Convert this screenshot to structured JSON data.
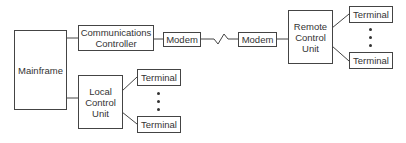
{
  "diagram": {
    "nodes": {
      "mainframe": {
        "label": "Mainframe"
      },
      "comm_controller": {
        "label": "Communications\nController"
      },
      "modem_local": {
        "label": "Modem"
      },
      "modem_remote": {
        "label": "Modem"
      },
      "remote_control_unit": {
        "label": "Remote\nControl\nUnit"
      },
      "remote_terminal_top": {
        "label": "Terminal"
      },
      "remote_terminal_bottom": {
        "label": "Terminal"
      },
      "local_control_unit": {
        "label": "Local\nControl\nUnit"
      },
      "local_terminal_top": {
        "label": "Terminal"
      },
      "local_terminal_bottom": {
        "label": "Terminal"
      }
    },
    "edges": [
      {
        "from": "mainframe",
        "to": "comm_controller",
        "style": "line"
      },
      {
        "from": "mainframe",
        "to": "local_control_unit",
        "style": "line"
      },
      {
        "from": "comm_controller",
        "to": "modem_local",
        "style": "line"
      },
      {
        "from": "modem_local",
        "to": "modem_remote",
        "style": "zigzag"
      },
      {
        "from": "modem_remote",
        "to": "remote_control_unit",
        "style": "line"
      },
      {
        "from": "remote_control_unit",
        "to": "remote_terminal_top",
        "style": "line"
      },
      {
        "from": "remote_control_unit",
        "to": "remote_terminal_bottom",
        "style": "line"
      },
      {
        "from": "local_control_unit",
        "to": "local_terminal_top",
        "style": "line"
      },
      {
        "from": "local_control_unit",
        "to": "local_terminal_bottom",
        "style": "line"
      }
    ],
    "ellipsis_marks": [
      "remote-terminals",
      "local-terminals"
    ]
  }
}
